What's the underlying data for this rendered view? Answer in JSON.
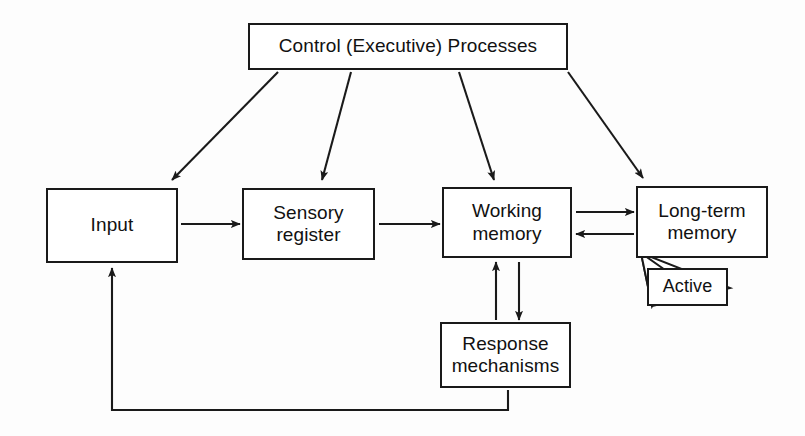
{
  "diagram": {
    "background_color": "#fdfdfd",
    "stroke_color": "#1a1a1a",
    "text_color": "#111111",
    "nodes": {
      "control": "Control (Executive) Processes",
      "input": "Input",
      "sensory": "Sensory\nregister",
      "working": "Working\nmemory",
      "longterm": "Long-term\nmemory",
      "response": "Response\nmechanisms",
      "active": "Active"
    },
    "connections": [
      {
        "name": "control-to-input",
        "from": "control",
        "to": "input",
        "style": "arrow",
        "direction": "diagonal-down-left"
      },
      {
        "name": "control-to-sensory",
        "from": "control",
        "to": "sensory",
        "style": "arrow",
        "direction": "diagonal-down-left"
      },
      {
        "name": "control-to-working",
        "from": "control",
        "to": "working",
        "style": "arrow",
        "direction": "diagonal-down-right"
      },
      {
        "name": "control-to-longterm",
        "from": "control",
        "to": "longterm",
        "style": "arrow",
        "direction": "diagonal-down-right"
      },
      {
        "name": "input-to-sensory",
        "from": "input",
        "to": "sensory",
        "style": "arrow",
        "direction": "right"
      },
      {
        "name": "sensory-to-working",
        "from": "sensory",
        "to": "working",
        "style": "arrow",
        "direction": "right"
      },
      {
        "name": "working-to-longterm",
        "from": "working",
        "to": "longterm",
        "style": "arrow",
        "direction": "right"
      },
      {
        "name": "longterm-to-working",
        "from": "longterm",
        "to": "working",
        "style": "arrow",
        "direction": "left"
      },
      {
        "name": "response-to-working",
        "from": "response",
        "to": "working",
        "style": "arrow",
        "direction": "up"
      },
      {
        "name": "working-to-response",
        "from": "working",
        "to": "response",
        "style": "arrow",
        "direction": "down"
      },
      {
        "name": "response-feedback-to-input",
        "from": "response",
        "to": "input",
        "style": "arrow",
        "direction": "feedback-loop-bottom"
      },
      {
        "name": "active-callout-to-longterm",
        "from": "active",
        "to": "longterm",
        "style": "callout-pointer",
        "direction": "up-left"
      }
    ]
  }
}
